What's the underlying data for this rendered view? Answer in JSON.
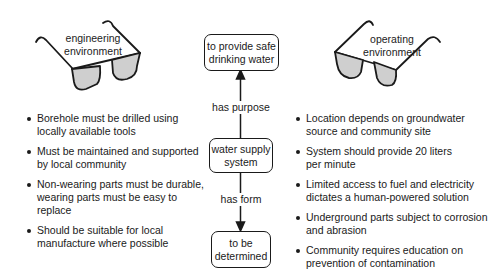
{
  "left_glasses": {
    "label_line1": "engineering",
    "label_line2": "environment"
  },
  "right_glasses": {
    "label_line1": "operating",
    "label_line2": "environment"
  },
  "center": {
    "top_box": {
      "line1": "to provide safe",
      "line2": "drinking water"
    },
    "edge_top": "has purpose",
    "middle_box": {
      "line1": "water supply",
      "line2": "system"
    },
    "edge_bottom": "has form",
    "bottom_box": {
      "line1": "to be",
      "line2": "determined"
    }
  },
  "left_list": [
    {
      "line1": "Borehole must be drilled using",
      "line2": "locally available tools"
    },
    {
      "line1": "Must be maintained and supported",
      "line2": "by local community"
    },
    {
      "line1": "Non-wearing parts must be durable,",
      "line2": "wearing parts must be easy to replace"
    },
    {
      "line1": "Should be suitable for local",
      "line2": "manufacture where possible"
    }
  ],
  "right_list": [
    {
      "line1": "Location depends on groundwater",
      "line2": "source and community site"
    },
    {
      "line1": "System should provide 20 liters",
      "line2": "per minute"
    },
    {
      "line1": "Limited access to fuel and electricity",
      "line2": "dictates a human-powered solution"
    },
    {
      "line1": "Underground parts subject to corrosion",
      "line2": "and abrasion"
    },
    {
      "line1": "Community requires education on",
      "line2": "prevention of contamination"
    }
  ],
  "colors": {
    "stroke": "#1a1a1a",
    "lens_fill": "#cfcfcf"
  }
}
